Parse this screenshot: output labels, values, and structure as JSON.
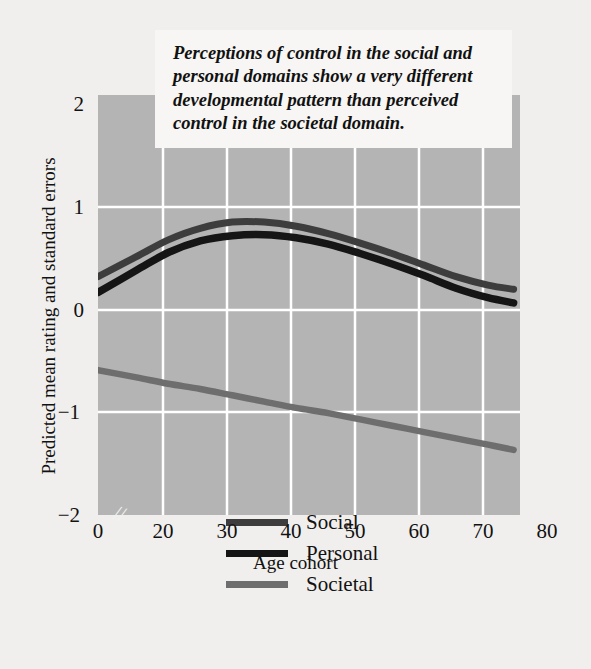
{
  "figure": {
    "background_color": "#f0efed",
    "plot_background_color": "#b4b4b4",
    "gridline_color": "#ffffff"
  },
  "annotation": {
    "text": "Perceptions of control in the social and personal domains show a very different developmental pattern than perceived control in the societal domain."
  },
  "axes": {
    "ylabel": "Predicted mean rating and standard errors",
    "xlabel": "Age cohort",
    "yticks": [
      "2",
      "1",
      "0",
      "−1",
      "−2"
    ],
    "xticks": [
      "0",
      "20",
      "30",
      "40",
      "50",
      "60",
      "70",
      "80"
    ],
    "break_marker": "//"
  },
  "legend": {
    "items": [
      {
        "label": "Social",
        "color": "#3d3d3d"
      },
      {
        "label": "Personal",
        "color": "#151515"
      },
      {
        "label": "Societal",
        "color": "#6e6e6e"
      }
    ]
  },
  "chart_data": {
    "type": "line",
    "title": "",
    "xlabel": "Age cohort",
    "ylabel": "Predicted mean rating and standard errors",
    "xlim": [
      14,
      80
    ],
    "ylim": [
      -2,
      2
    ],
    "xticks": [
      0,
      20,
      30,
      40,
      50,
      60,
      70,
      80
    ],
    "yticks": [
      2,
      1,
      0,
      -1,
      -2
    ],
    "x_axis_break_between": [
      0,
      20
    ],
    "grid": true,
    "legend_position": "inside-lower-left",
    "annotation": "Perceptions of control in the social and personal domains show a very different developmental pattern than perceived control in the societal domain.",
    "x": [
      14,
      20,
      25,
      30,
      35,
      40,
      45,
      50,
      55,
      60,
      65,
      70,
      75,
      79
    ],
    "series": [
      {
        "name": "Social",
        "color": "#3d3d3d",
        "values": [
          0.27,
          0.46,
          0.62,
          0.73,
          0.79,
          0.79,
          0.75,
          0.68,
          0.59,
          0.49,
          0.38,
          0.27,
          0.19,
          0.15
        ]
      },
      {
        "name": "Personal",
        "color": "#151515",
        "values": [
          0.12,
          0.33,
          0.5,
          0.61,
          0.66,
          0.67,
          0.64,
          0.58,
          0.49,
          0.39,
          0.28,
          0.16,
          0.07,
          0.02
        ]
      },
      {
        "name": "Societal",
        "color": "#6e6e6e",
        "values": [
          -0.62,
          -0.69,
          -0.75,
          -0.8,
          -0.86,
          -0.92,
          -0.98,
          -1.03,
          -1.09,
          -1.15,
          -1.21,
          -1.27,
          -1.33,
          -1.38
        ]
      }
    ]
  }
}
